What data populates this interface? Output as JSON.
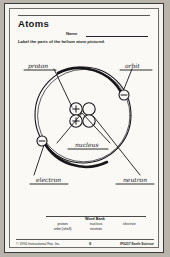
{
  "worksheet": {
    "title": "Atoms",
    "name_label": "Name",
    "instruction": "Label the parts of the helium atom pictured."
  },
  "labels": {
    "proton": "proton",
    "orbit": "orbit",
    "nucleus": "nucleus",
    "electron": "electron",
    "neutron": "neutron"
  },
  "diagram": {
    "particle_proton_charge": "+",
    "particle_electron_charge": "−",
    "proton_count": 2,
    "neutron_count": 2,
    "electron_count": 2
  },
  "word_bank": {
    "title": "Word Bank",
    "rows": [
      [
        "proton",
        "nucleus",
        "electron"
      ],
      [
        "orbit (shell)",
        "neutron",
        ""
      ]
    ]
  },
  "footer": {
    "copyright": "© 1994 Instructional Fair, Inc.",
    "page": "9",
    "code": "IF0237 Earth Science"
  },
  "colors": {
    "paper": "#faf9f6",
    "ink": "#17171a",
    "border": "#6e6c68"
  }
}
